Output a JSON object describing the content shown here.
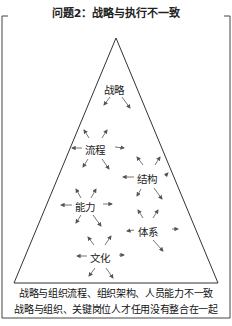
{
  "title": "问题2：战略与执行不一致",
  "nodes": [
    {
      "id": "strategy",
      "label": "战略"
    },
    {
      "id": "process",
      "label": "流程"
    },
    {
      "id": "structure",
      "label": "结构"
    },
    {
      "id": "capability",
      "label": "能力"
    },
    {
      "id": "system",
      "label": "体系"
    },
    {
      "id": "culture",
      "label": "文化"
    }
  ],
  "caption": {
    "line1": "战略与组织流程、组织架构、人员能力不一致",
    "line2": "战略与组织、关键岗位人才任用没有整合在一起"
  },
  "colors": {
    "line": "#333333",
    "arrow": "#555555",
    "text": "#222222"
  }
}
